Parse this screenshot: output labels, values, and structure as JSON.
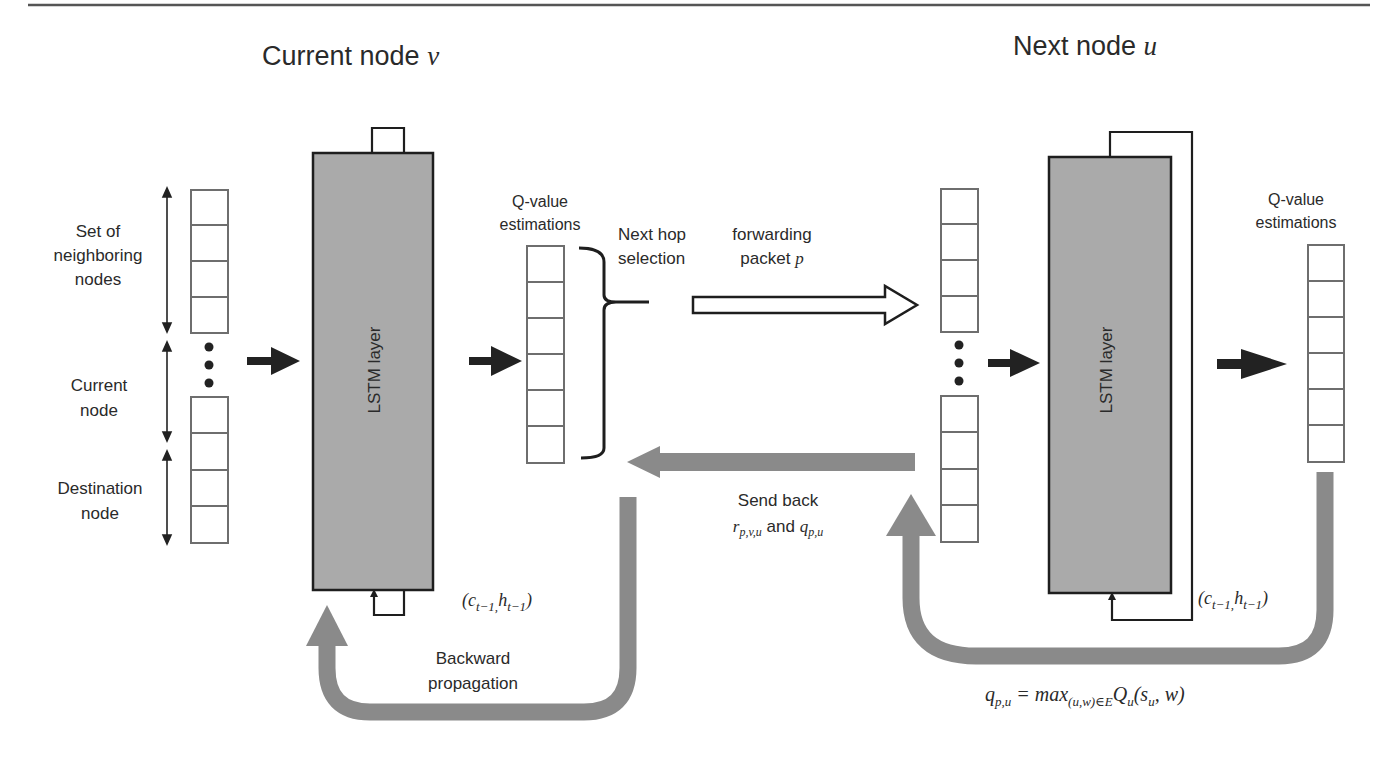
{
  "diagram": {
    "left_node": {
      "title": "Current node",
      "title_var": "v",
      "input_labels": {
        "neighbors_line1": "Set of",
        "neighbors_line2": "neighboring",
        "neighbors_line3": "nodes",
        "current_line1": "Current",
        "current_line2": "node",
        "destination_line1": "Destination",
        "destination_line2": "node"
      },
      "lstm_label": "LSTM layer",
      "output_label_line1": "Q-value",
      "output_label_line2": "estimations",
      "recurrent_state": "(c",
      "recurrent_state_sub1": "t−1,",
      "recurrent_state_mid": "h",
      "recurrent_state_sub2": "t−1",
      "recurrent_state_close": ")"
    },
    "right_node": {
      "title": "Next node",
      "title_var": "u",
      "lstm_label": "LSTM layer",
      "output_label_line1": "Q-value",
      "output_label_line2": "estimations",
      "recurrent_state": "(c",
      "recurrent_state_sub1": "t−1,",
      "recurrent_state_mid": "h",
      "recurrent_state_sub2": "t−1",
      "recurrent_state_close": ")"
    },
    "next_hop": {
      "line1": "Next hop",
      "line2": "selection"
    },
    "forwarding": {
      "line1": "forwarding",
      "line2": "packet",
      "var": "p"
    },
    "send_back": {
      "line1": "Send back",
      "r_sym": "r",
      "r_sub": "p,v,u",
      "and": " and ",
      "q_sym": "q",
      "q_sub": "p,u"
    },
    "backward": {
      "line1": "Backward",
      "line2": "propagation"
    },
    "equation": {
      "lhs": "q",
      "lhs_sub": "p,u",
      "eq": " = max",
      "max_sub": "(u,w)∈E",
      "Q": "Q",
      "Q_sub": "u",
      "args_open": "(s",
      "s_sub": "u",
      "args_close": ", w)"
    },
    "colors": {
      "lstm_fill": "#aaaaaa",
      "feedback_arrow": "#8a8a8a",
      "cell_border": "#6e6e6e",
      "dark_arrow": "#222222"
    },
    "vector_counts": {
      "input_upper_cells": 4,
      "input_lower_cells": 4,
      "output_cells": 6
    }
  }
}
